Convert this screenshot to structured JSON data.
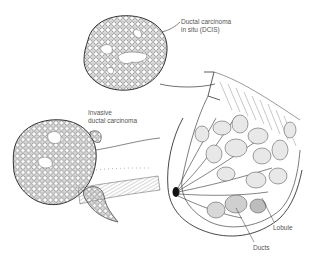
{
  "diagram": {
    "labels": {
      "dcis": "Ductal carcinoma\nin situ (DCIS)",
      "invasive": "Invasive\nductal carcinoma",
      "lobule": "Lobule",
      "ducts": "Ducts"
    },
    "colors": {
      "line": "#333333",
      "text": "#555555",
      "background": "#ffffff"
    }
  }
}
